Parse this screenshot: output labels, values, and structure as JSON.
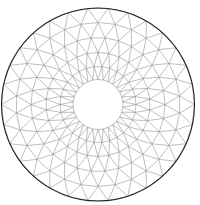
{
  "diagram": {
    "type": "triangulated-annulus-mesh",
    "center": [
      98,
      104.5
    ],
    "outer_radius": 96.5,
    "inner_radius": 25,
    "rings": [
      {
        "r": 25,
        "n": 30
      },
      {
        "r": 38,
        "n": 30
      },
      {
        "r": 52,
        "n": 30
      },
      {
        "r": 67,
        "n": 30
      },
      {
        "r": 82,
        "n": 30
      },
      {
        "r": 96.5,
        "n": 30
      }
    ],
    "colors": {
      "background": "#ffffff",
      "mesh_edge": "#8a8a8a",
      "outer_boundary": "#222222"
    }
  }
}
